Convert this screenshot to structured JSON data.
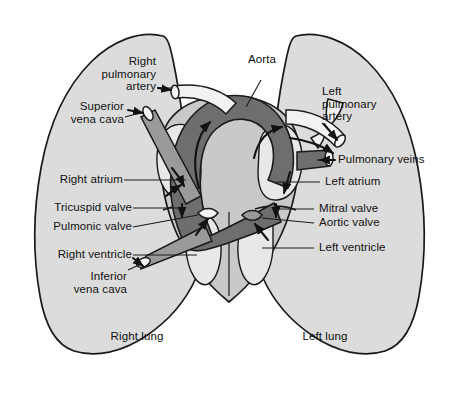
{
  "figure": {
    "kind": "anatomical-illustration"
  },
  "colors": {
    "background": "#ffffff",
    "outline": "#1a1a1a",
    "lung_fill": "#dcdcdc",
    "heart_fill": "#c9c9c9",
    "chamber_fill": "#e8e8e8",
    "aorta_fill": "#6e6e6e",
    "vein_fill": "#9a9a9a",
    "vessel_light_fill": "#f2f2f2",
    "label_text": "#111111",
    "leader_line": "#1a1a1a"
  },
  "labels": {
    "right_pulmonary_artery": "Right\npulmonary\nartery",
    "superior_vena_cava": "Superior\nvena cava",
    "right_atrium": "Right atrium",
    "tricuspid_valve": "Tricuspid valve",
    "pulmonic_valve": "Pulmonic valve",
    "right_ventricle": "Right ventricle",
    "inferior_vena_cava": "Inferior\nvena cava",
    "aorta": "Aorta",
    "left_pulmonary_artery": "Left\npulmonary\nartery",
    "pulmonary_veins": "Pulmonary veins",
    "left_atrium": "Left atrium",
    "mitral_valve": "Mitral valve",
    "aortic_valve": "Aortic valve",
    "left_ventricle": "Left ventricle",
    "right_lung": "Right lung",
    "left_lung": "Left lung"
  },
  "structures": [
    {
      "id": "right-lung",
      "name": "Right lung",
      "side": "right"
    },
    {
      "id": "left-lung",
      "name": "Left lung",
      "side": "left"
    },
    {
      "id": "aorta",
      "name": "Aorta",
      "shade": "dark"
    },
    {
      "id": "superior-vena-cava",
      "name": "Superior vena cava",
      "shade": "medium"
    },
    {
      "id": "inferior-vena-cava",
      "name": "Inferior vena cava",
      "shade": "medium"
    },
    {
      "id": "right-pulmonary-artery",
      "name": "Right pulmonary artery",
      "shade": "light"
    },
    {
      "id": "left-pulmonary-artery",
      "name": "Left pulmonary artery",
      "shade": "light"
    },
    {
      "id": "pulmonary-veins",
      "name": "Pulmonary veins",
      "shade": "medium"
    },
    {
      "id": "right-atrium",
      "name": "Right atrium",
      "shade": "chamber"
    },
    {
      "id": "left-atrium",
      "name": "Left atrium",
      "shade": "chamber"
    },
    {
      "id": "right-ventricle",
      "name": "Right ventricle",
      "shade": "chamber"
    },
    {
      "id": "left-ventricle",
      "name": "Left ventricle",
      "shade": "chamber"
    },
    {
      "id": "tricuspid-valve",
      "name": "Tricuspid valve",
      "shade": "outline"
    },
    {
      "id": "mitral-valve",
      "name": "Mitral valve",
      "shade": "outline"
    },
    {
      "id": "pulmonic-valve",
      "name": "Pulmonic valve",
      "shade": "outline"
    },
    {
      "id": "aortic-valve",
      "name": "Aortic valve",
      "shade": "outline"
    }
  ]
}
